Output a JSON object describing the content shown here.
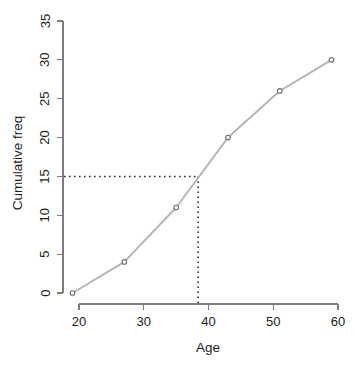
{
  "chart_data": {
    "type": "line",
    "title": "",
    "subtitle": "",
    "xlabel": "Age",
    "ylabel": "Cumulative freq",
    "x": [
      19,
      27,
      35,
      43,
      51,
      59
    ],
    "values": [
      0,
      4,
      11,
      20,
      26,
      30
    ],
    "series": [
      {
        "name": "Cumulative frequency",
        "x": [
          19,
          27,
          35,
          43,
          51,
          59
        ],
        "values": [
          0,
          4,
          11,
          20,
          26,
          30
        ]
      }
    ],
    "xlim": [
      19,
      60
    ],
    "ylim": [
      0,
      35
    ],
    "xticks": [
      20,
      30,
      40,
      50,
      60
    ],
    "yticks": [
      0,
      5,
      10,
      15,
      20,
      25,
      30,
      35
    ],
    "xtick_labels": [
      "20",
      "30",
      "40",
      "50",
      "60"
    ],
    "ytick_labels": [
      "0",
      "5",
      "10",
      "15",
      "20",
      "25",
      "30",
      "35"
    ],
    "grid": false,
    "legend": false,
    "legend_position": "none",
    "annotations": [
      {
        "name": "median-reference-lines",
        "type": "dashed-crosshair",
        "y_value": 15,
        "x_value": 38.4,
        "description": "Dotted horizontal line from y-axis at cumulative freq 15 meeting the curve, then dotted vertical line down to the Age axis at about 38.4"
      }
    ],
    "colors": {
      "line": "#b4b4b4",
      "point_stroke": "#6e6e6e",
      "point_fill": "#ffffff",
      "axis": "#7d7d7d",
      "reference_line": "#2a2a2a",
      "text": "#1c1c1c",
      "background": "#ffffff"
    }
  },
  "labels": {
    "x_axis_title": "Age",
    "y_axis_title": "Cumulative freq"
  }
}
